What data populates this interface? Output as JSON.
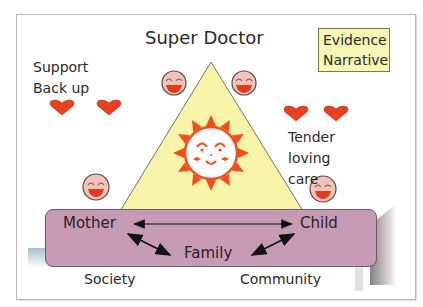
{
  "diagram": {
    "title": "Super Doctor",
    "legend": {
      "line1": "Evidence",
      "line2": "Narrative"
    },
    "left_note": {
      "line1": "Support",
      "line2": "Back up"
    },
    "right_note": {
      "line1": "Tender loving",
      "line2": "care"
    },
    "base_box": {
      "nodes": [
        "Mother",
        "Child",
        "Family"
      ],
      "edges": [
        {
          "from": "Mother",
          "to": "Child",
          "type": "bidirectional"
        },
        {
          "from": "Mother",
          "to": "Family",
          "type": "bidirectional"
        },
        {
          "from": "Child",
          "to": "Family",
          "type": "bidirectional"
        }
      ]
    },
    "ground_labels": {
      "left": "Society",
      "right": "Community"
    },
    "icons": {
      "center": "smiling-sun-icon",
      "faces": [
        "laughing-face-icon",
        "laughing-face-icon",
        "laughing-face-icon",
        "laughing-face-icon"
      ],
      "hearts": [
        "heart-icon",
        "heart-icon",
        "heart-icon",
        "heart-icon"
      ]
    },
    "colors": {
      "triangle_fill": "#f7f3a8",
      "base_fill": "#c79bb3",
      "legend_fill": "#f6f7b5",
      "heart": "#e8401e",
      "sun": "#f04e1c",
      "face_fill": "#f2c4b8"
    }
  }
}
